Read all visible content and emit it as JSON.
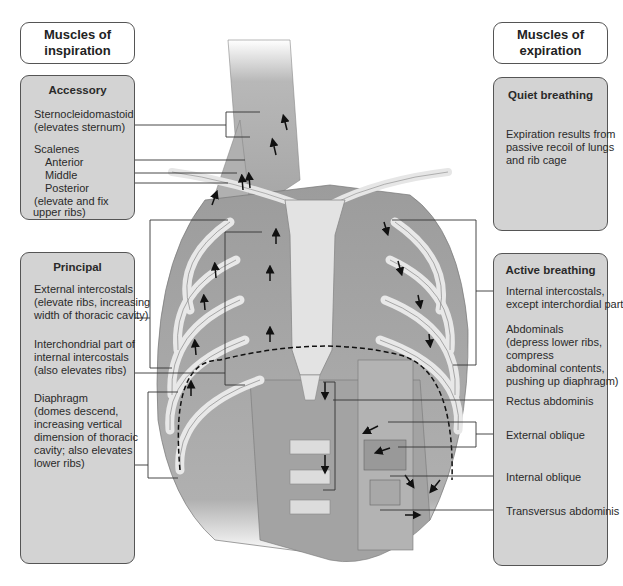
{
  "left": {
    "header": {
      "line1": "Muscles of",
      "line2": "inspiration"
    },
    "accessory": {
      "title": "Accessory",
      "scm1": "Sternocleidomastoid",
      "scm2": "(elevates sternum)",
      "scalenes": "Scalenes",
      "anterior": "Anterior",
      "middle": "Middle",
      "posterior": "Posterior",
      "note1": "(elevate and fix",
      "note2": "upper ribs)"
    },
    "principal": {
      "title": "Principal",
      "ext1": "External intercostals",
      "ext2": "(elevate ribs, increasing",
      "ext3": "width of thoracic cavity)",
      "int1": "Interchondrial part of",
      "int2": "internal intercostals",
      "int3": "(also elevates ribs)",
      "dia1": "Diaphragm",
      "dia2": "(domes descend,",
      "dia3": "increasing vertical",
      "dia4": "dimension of thoracic",
      "dia5": "cavity; also elevates",
      "dia6": "lower ribs)"
    }
  },
  "right": {
    "header": {
      "line1": "Muscles of",
      "line2": "expiration"
    },
    "quiet": {
      "title": "Quiet breathing",
      "l1": "Expiration results from",
      "l2": "passive recoil of lungs",
      "l3": "and rib cage"
    },
    "active": {
      "title": "Active breathing",
      "ii1": "Internal intercostals,",
      "ii2": "except interchordial part",
      "ab1": "Abdominals",
      "ab2": "(depress lower ribs,",
      "ab3": "compress",
      "ab4": "abdominal contents,",
      "ab5": "pushing up diaphragm)",
      "rectus": "Rectus abdominis",
      "ext_oblique": "External oblique",
      "int_oblique": "Internal oblique",
      "transversus": "Transversus abdominis"
    }
  },
  "colors": {
    "panel": "#d3d3d3",
    "border": "#555555",
    "muscle": "#9a9a9a",
    "bone": "#e6e6e6"
  }
}
